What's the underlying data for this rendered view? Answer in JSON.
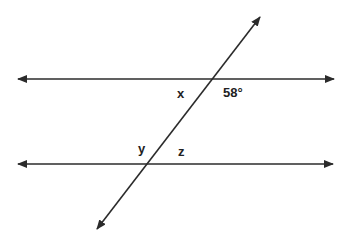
{
  "diagram": {
    "type": "parallel-lines-cut-by-transversal",
    "stroke_color": "#2b2b2b",
    "text_color": "#222222",
    "lines": {
      "top_parallel": {
        "x1": 18,
        "y1": 79,
        "x2": 334,
        "y2": 79,
        "arrows": "both"
      },
      "bottom_parallel": {
        "x1": 18,
        "y1": 164,
        "x2": 333,
        "y2": 164,
        "arrows": "both"
      },
      "transversal": {
        "x1": 260,
        "y1": 17,
        "x2": 97,
        "y2": 229,
        "arrows": "both"
      }
    },
    "intersections": {
      "top": {
        "x": 211,
        "y": 79
      },
      "bottom": {
        "x": 147,
        "y": 164
      }
    },
    "labels": {
      "x": "x",
      "angle_58": "58°",
      "y": "y",
      "z": "z"
    }
  }
}
